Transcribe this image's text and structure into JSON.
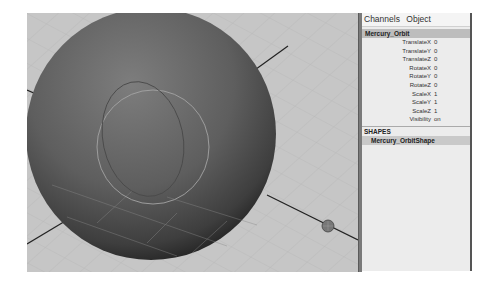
{
  "viewport": {
    "background": "#c4c4c4",
    "object": "sphere",
    "selected_object": "Mercury_Orbit"
  },
  "channel_box": {
    "menu": [
      "Channels",
      "Object"
    ],
    "object_name": "Mercury_Orbit",
    "channels": [
      {
        "label": "TranslateX",
        "value": "0"
      },
      {
        "label": "TranslateY",
        "value": "0"
      },
      {
        "label": "TranslateZ",
        "value": "0"
      },
      {
        "label": "RotateX",
        "value": "0"
      },
      {
        "label": "RotateY",
        "value": "0"
      },
      {
        "label": "RotateZ",
        "value": "0"
      },
      {
        "label": "ScaleX",
        "value": "1"
      },
      {
        "label": "ScaleY",
        "value": "1"
      },
      {
        "label": "ScaleZ",
        "value": "1"
      },
      {
        "label": "Visibility",
        "value": "on"
      }
    ],
    "shapes_header": "SHAPES",
    "shapes": [
      "Mercury_OrbitShape"
    ]
  }
}
